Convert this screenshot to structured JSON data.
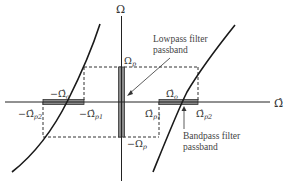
{
  "axes": {
    "vertical_label": "Ω",
    "horizontal_label": "Ω̂"
  },
  "labels": {
    "omega_p": "Ω",
    "omega_p_sub": "p",
    "neg_omega_p": "−Ω",
    "neg_omega_p_sub": "p",
    "omega_o": "Ω̂",
    "omega_o_sub": "o",
    "neg_omega_o": "−Ω̂",
    "neg_omega_o_sub": "o",
    "omega_p1": "Ω̂",
    "omega_p1_sub": "p1",
    "omega_p2": "Ω̂",
    "omega_p2_sub": "p2",
    "neg_omega_p1": "−Ω̂",
    "neg_omega_p1_sub": "p1",
    "neg_omega_p2": "−Ω̂",
    "neg_omega_p2_sub": "p2"
  },
  "annotations": {
    "lowpass_line1": "Lowpass filter",
    "lowpass_line2": "passband",
    "bandpass_line1": "Bandpass filter",
    "bandpass_line2": "passband"
  },
  "colors": {
    "axis": "#222222",
    "curve": "#1a1a1a",
    "band_fill": "#8a8a8a",
    "dashed": "#333333"
  }
}
